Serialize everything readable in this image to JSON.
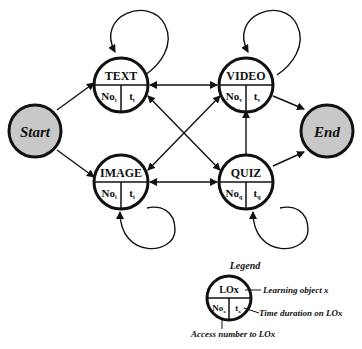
{
  "diagram": {
    "type": "state-transition",
    "colors": {
      "stroke": "#111111",
      "terminal_fill": "#c8c8c8",
      "node_fill": "#ffffff"
    },
    "terminals": {
      "start": {
        "label": "Start"
      },
      "end": {
        "label": "End"
      }
    },
    "nodes": [
      {
        "id": "text",
        "label": "TEXT",
        "no": "No",
        "no_sub": "t",
        "t": "t",
        "t_sub": "t"
      },
      {
        "id": "video",
        "label": "VIDEO",
        "no": "No",
        "no_sub": "v",
        "t": "t",
        "t_sub": "v"
      },
      {
        "id": "image",
        "label": "IMAGE",
        "no": "No",
        "no_sub": "i",
        "t": "t",
        "t_sub": "i"
      },
      {
        "id": "quiz",
        "label": "QUIZ",
        "no": "No",
        "no_sub": "q",
        "t": "t",
        "t_sub": "q"
      }
    ],
    "edges": [
      {
        "from": "Start",
        "to": "TEXT"
      },
      {
        "from": "Start",
        "to": "IMAGE"
      },
      {
        "from": "TEXT",
        "to": "VIDEO",
        "bidirectional": true
      },
      {
        "from": "IMAGE",
        "to": "QUIZ",
        "bidirectional": true
      },
      {
        "from": "TEXT",
        "to": "QUIZ",
        "bidirectional": true
      },
      {
        "from": "IMAGE",
        "to": "VIDEO",
        "bidirectional": true
      },
      {
        "from": "QUIZ",
        "to": "VIDEO"
      },
      {
        "from": "VIDEO",
        "to": "End"
      },
      {
        "from": "QUIZ",
        "to": "End"
      },
      {
        "from": "TEXT",
        "to": "TEXT",
        "self_loop": true
      },
      {
        "from": "VIDEO",
        "to": "VIDEO",
        "self_loop": true
      },
      {
        "from": "IMAGE",
        "to": "IMAGE",
        "self_loop": true
      },
      {
        "from": "QUIZ",
        "to": "QUIZ",
        "self_loop": true
      }
    ]
  },
  "legend": {
    "title": "Legend",
    "node_label": "LOx",
    "no": "No",
    "no_sub": "x",
    "t": "t",
    "t_sub": "x",
    "annotations": {
      "learning_object": "Learning object x",
      "time_duration": "Time duration on LOx",
      "access_number": "Access number to LOx"
    }
  }
}
